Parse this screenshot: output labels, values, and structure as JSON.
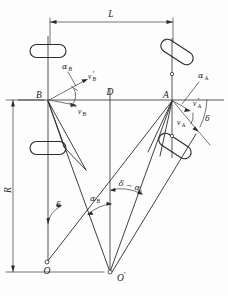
{
  "figure": {
    "type": "engineering-diagram",
    "points": [
      {
        "id": "B",
        "label": "B",
        "x": 48,
        "y": 100
      },
      {
        "id": "D",
        "label": "D",
        "x": 110,
        "y": 100
      },
      {
        "id": "A",
        "label": "A",
        "x": 172,
        "y": 100
      },
      {
        "id": "O",
        "label": "O",
        "x": 47,
        "y": 262
      },
      {
        "id": "Oprime",
        "label": "O",
        "prime": "'",
        "x": 110,
        "y": 272
      }
    ],
    "dimensions": [
      {
        "name": "wheelbase",
        "label": "L",
        "orientation": "horizontal",
        "from_x": 50,
        "to_x": 173,
        "y": 22,
        "label_x": 111,
        "label_y": 18
      },
      {
        "name": "turn-radius",
        "label": "R",
        "orientation": "vertical",
        "x": 13,
        "from_y": 100,
        "to_y": 272,
        "label_x": 11,
        "label_y": 190
      }
    ],
    "angles": [
      {
        "name": "slip-angle-rear",
        "label": "α",
        "subscript": "B",
        "label_x": 62,
        "label_y": 69
      },
      {
        "name": "slip-angle-front",
        "label": "α",
        "subscript": "A",
        "label_x": 200,
        "label_y": 78
      },
      {
        "name": "steer-angle",
        "label": "δ",
        "subscript": "",
        "label_x": 204,
        "label_y": 120
      },
      {
        "name": "delta-at-O",
        "label": "δ",
        "subscript": "",
        "label_x": 56,
        "label_y": 206
      },
      {
        "name": "alpha-B-at-Oprime",
        "label": "α",
        "subscript": "B",
        "label_x": 92,
        "label_y": 206
      },
      {
        "name": "delta-minus-alpha-A",
        "label": "δ − α",
        "subscript": "A",
        "label_x": 125,
        "label_y": 190
      }
    ],
    "vectors": [
      {
        "name": "velocity-rear-actual",
        "label": "v",
        "subscript": "B",
        "prime": "",
        "label_x": 79,
        "label_y": 113
      },
      {
        "name": "velocity-rear-resultant",
        "label": "v",
        "subscript": "B",
        "prime": "'",
        "label_x": 89,
        "label_y": 82
      },
      {
        "name": "velocity-front-resultant",
        "label": "v",
        "subscript": "A",
        "prime": "'",
        "label_x": 191,
        "label_y": 106
      },
      {
        "name": "velocity-front-actual",
        "label": "v",
        "subscript": "A",
        "prime": "",
        "label_x": 178,
        "label_y": 124
      }
    ],
    "wheels": [
      {
        "name": "rear-left-wheel",
        "cx": 48,
        "cy": 51,
        "rotation": 0
      },
      {
        "name": "rear-right-wheel",
        "cx": 48,
        "cy": 148,
        "rotation": 0
      },
      {
        "name": "front-left-wheel",
        "cx": 177,
        "cy": 52,
        "rotation": 33
      },
      {
        "name": "front-right-wheel",
        "cx": 175,
        "cy": 146,
        "rotation": 33
      }
    ],
    "colors": {
      "ink": "#2b2b2b",
      "background": "#ffffff",
      "thin_ink": "#3a3a3a"
    }
  }
}
